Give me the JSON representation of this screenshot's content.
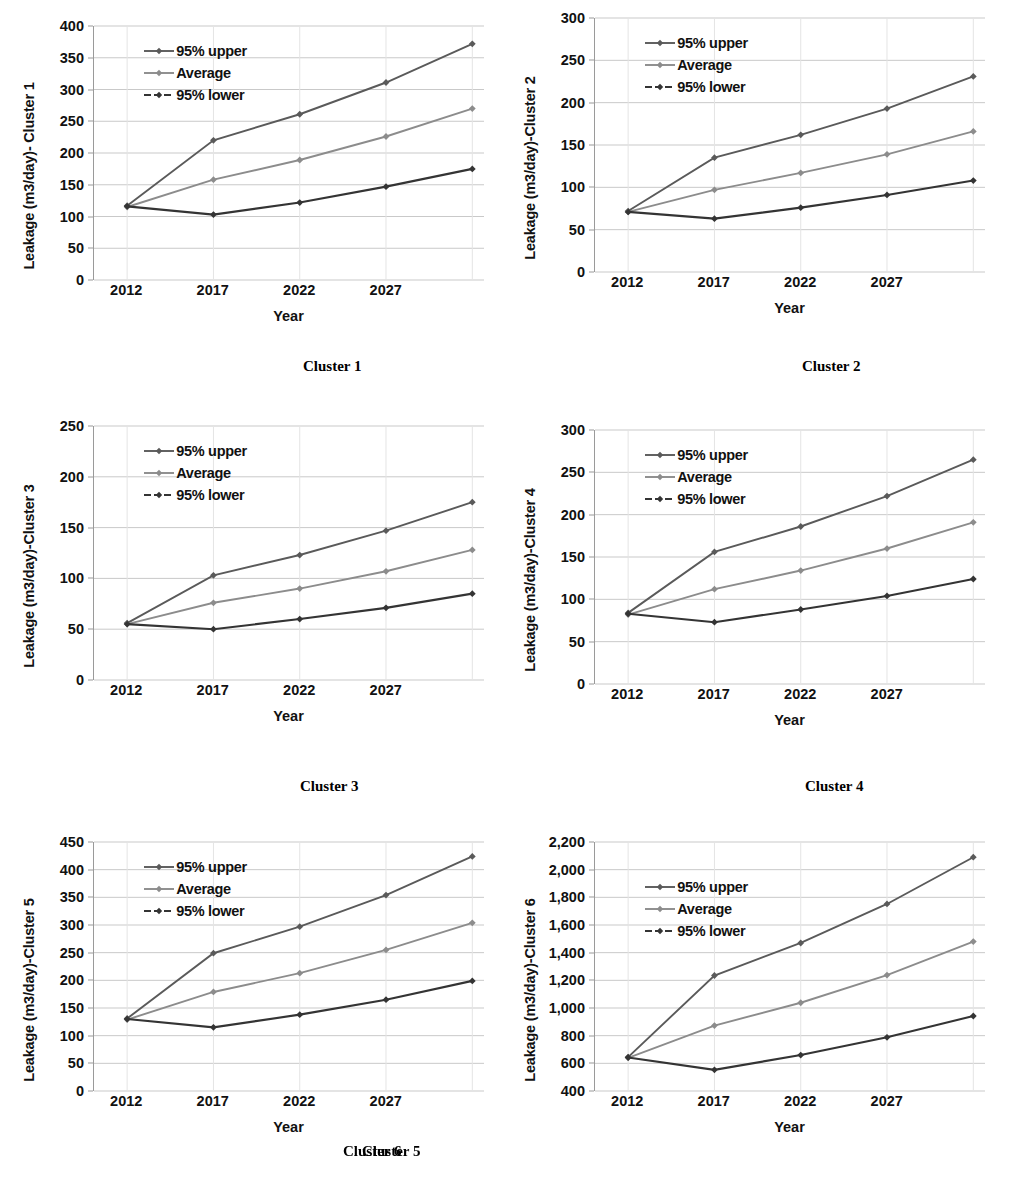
{
  "figure": {
    "series_names": [
      "95% upper",
      "Average",
      "95% lower"
    ],
    "colors": {
      "upper": "#5a5a5a",
      "average": "#8c8c8c",
      "lower": "#343434",
      "gridline": "#c9c9c9",
      "axis": "#9a9a9a"
    },
    "xlabel": "Year",
    "xtick_labels": [
      "2012",
      "2017",
      "2022",
      "2027"
    ]
  },
  "chart_data": [
    {
      "type": "line",
      "caption": "Cluster 1",
      "title": "",
      "ylabel": "Leakage (m3/day)- Cluster 1",
      "xlabel": "Year",
      "categories": [
        "2012",
        "2017",
        "2022",
        "2027",
        "2032"
      ],
      "xtick_labels": [
        "2012",
        "2017",
        "2022",
        "2027"
      ],
      "ylim": [
        0,
        400
      ],
      "yticks": [
        0,
        50,
        100,
        150,
        200,
        250,
        300,
        350,
        400
      ],
      "ytick_labels": [
        "0",
        "50",
        "100",
        "150",
        "200",
        "250",
        "300",
        "350",
        "400"
      ],
      "grid": true,
      "legend_position": "upper-left-inside",
      "series": [
        {
          "name": "95% upper",
          "values": [
            117,
            220,
            261,
            311,
            372
          ]
        },
        {
          "name": "Average",
          "values": [
            115,
            158,
            189,
            226,
            270
          ]
        },
        {
          "name": "95% lower",
          "values": [
            116,
            103,
            122,
            147,
            175
          ]
        }
      ]
    },
    {
      "type": "line",
      "caption": "Cluster 2",
      "title": "",
      "ylabel": "Leakage (m3/day)-Cluster 2",
      "xlabel": "Year",
      "categories": [
        "2012",
        "2017",
        "2022",
        "2027",
        "2032"
      ],
      "xtick_labels": [
        "2012",
        "2017",
        "2022",
        "2027"
      ],
      "ylim": [
        0,
        300
      ],
      "yticks": [
        0,
        50,
        100,
        150,
        200,
        250,
        300
      ],
      "ytick_labels": [
        "0",
        "50",
        "100",
        "150",
        "200",
        "250",
        "300"
      ],
      "grid": true,
      "legend_position": "upper-left-inside",
      "series": [
        {
          "name": "95% upper",
          "values": [
            72,
            135,
            162,
            193,
            231
          ]
        },
        {
          "name": "Average",
          "values": [
            71,
            97,
            117,
            139,
            166
          ]
        },
        {
          "name": "95% lower",
          "values": [
            71,
            63,
            76,
            91,
            108
          ]
        }
      ]
    },
    {
      "type": "line",
      "caption": "Cluster 3",
      "title": "",
      "ylabel": "Leakage (m3/day)-Cluster 3",
      "xlabel": "Year",
      "categories": [
        "2012",
        "2017",
        "2022",
        "2027",
        "2032"
      ],
      "xtick_labels": [
        "2012",
        "2017",
        "2022",
        "2027"
      ],
      "ylim": [
        0,
        250
      ],
      "yticks": [
        0,
        50,
        100,
        150,
        200,
        250
      ],
      "ytick_labels": [
        "0",
        "50",
        "100",
        "150",
        "200",
        "250"
      ],
      "grid": true,
      "legend_position": "upper-left-inside",
      "series": [
        {
          "name": "95% upper",
          "values": [
            56,
            103,
            123,
            147,
            175
          ]
        },
        {
          "name": "Average",
          "values": [
            55,
            76,
            90,
            107,
            128
          ]
        },
        {
          "name": "95% lower",
          "values": [
            55,
            50,
            60,
            71,
            85
          ]
        }
      ]
    },
    {
      "type": "line",
      "caption": "Cluster 4",
      "title": "",
      "ylabel": "Leakage (m3/day)-Cluster 4",
      "xlabel": "Year",
      "categories": [
        "2012",
        "2017",
        "2022",
        "2027",
        "2032"
      ],
      "xtick_labels": [
        "2012",
        "2017",
        "2022",
        "2027"
      ],
      "ylim": [
        0,
        300
      ],
      "yticks": [
        0,
        50,
        100,
        150,
        200,
        250,
        300
      ],
      "ytick_labels": [
        "0",
        "50",
        "100",
        "150",
        "200",
        "250",
        "300"
      ],
      "grid": true,
      "legend_position": "upper-left-inside",
      "series": [
        {
          "name": "95% upper",
          "values": [
            84,
            156,
            186,
            222,
            265
          ]
        },
        {
          "name": "Average",
          "values": [
            82,
            112,
            134,
            160,
            191
          ]
        },
        {
          "name": "95% lower",
          "values": [
            83,
            73,
            88,
            104,
            124
          ]
        }
      ]
    },
    {
      "type": "line",
      "caption": "Cluster 5",
      "title": "",
      "ylabel": "Leakage (m3/day)-Cluster 5",
      "xlabel": "Year",
      "categories": [
        "2012",
        "2017",
        "2022",
        "2027",
        "2032"
      ],
      "xtick_labels": [
        "2012",
        "2017",
        "2022",
        "2027"
      ],
      "ylim": [
        0,
        450
      ],
      "yticks": [
        0,
        50,
        100,
        150,
        200,
        250,
        300,
        350,
        400,
        450
      ],
      "ytick_labels": [
        "0",
        "50",
        "100",
        "150",
        "200",
        "250",
        "300",
        "350",
        "400",
        "450"
      ],
      "grid": true,
      "legend_position": "upper-left-inside",
      "series": [
        {
          "name": "95% upper",
          "values": [
            131,
            249,
            297,
            354,
            424
          ]
        },
        {
          "name": "Average",
          "values": [
            129,
            179,
            213,
            255,
            304
          ]
        },
        {
          "name": "95% lower",
          "values": [
            130,
            115,
            138,
            165,
            199
          ]
        }
      ]
    },
    {
      "type": "line",
      "caption": "Cluster 6",
      "title": "",
      "ylabel": "Leakage (m3/day)-Cluster 6",
      "xlabel": "Year",
      "categories": [
        "2012",
        "2017",
        "2022",
        "2027",
        "2032"
      ],
      "xtick_labels": [
        "2012",
        "2017",
        "2022",
        "2027"
      ],
      "ylim": [
        400,
        2200
      ],
      "yticks": [
        400,
        600,
        800,
        1000,
        1200,
        1400,
        1600,
        1800,
        2000,
        2200
      ],
      "ytick_labels": [
        "400",
        "600",
        "800",
        "1,000",
        "1,200",
        "1,400",
        "1,600",
        "1,800",
        "2,000",
        "2,200"
      ],
      "grid": true,
      "legend_position": "upper-left-inside",
      "series": [
        {
          "name": "95% upper",
          "values": [
            645,
            1235,
            1470,
            1752,
            2090
          ]
        },
        {
          "name": "Average",
          "values": [
            640,
            873,
            1038,
            1238,
            1480
          ]
        },
        {
          "name": "95% lower",
          "values": [
            642,
            553,
            660,
            788,
            942
          ]
        }
      ]
    }
  ]
}
